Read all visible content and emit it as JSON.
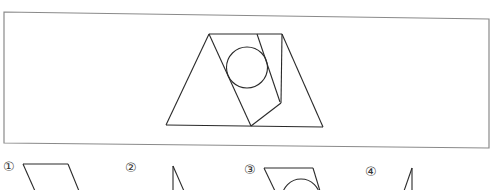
{
  "question": {
    "frame": {
      "x1": 4,
      "y1": 12,
      "x2": 489,
      "y2": 12,
      "x3": 489,
      "y3": 148,
      "x4": 4,
      "y4": 143,
      "stroke": "#8a8a8a"
    },
    "figure": {
      "stroke": "#2a2a2a",
      "trapezoid": "209,34 282,34 323,127 166,125",
      "strip_left_line": "209,34 251,126",
      "strip_right_line": "257,34 280,102",
      "right_vertical": "282,34 281,103",
      "bottom_fold": "281,103 251,126",
      "circle": {
        "cx": 247,
        "cy": 67.5,
        "r": 20.5
      }
    }
  },
  "options": [
    {
      "id": 1,
      "label": "①",
      "label_x": 4,
      "label_y": 161
    },
    {
      "id": 2,
      "label": "②",
      "label_x": 126,
      "label_y": 162
    },
    {
      "id": 3,
      "label": "③",
      "label_x": 245,
      "label_y": 164
    },
    {
      "id": 4,
      "label": "④",
      "label_x": 366,
      "label_y": 166
    }
  ]
}
